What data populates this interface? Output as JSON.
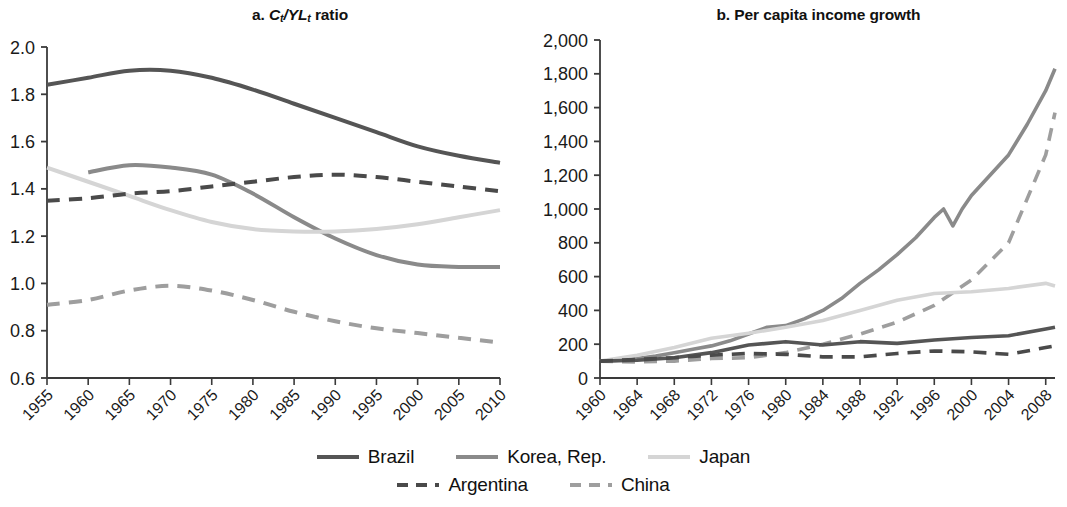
{
  "figure": {
    "background": "#ffffff",
    "panels": [
      {
        "id": "a",
        "title_plain": "a. Ct/YLt ratio"
      },
      {
        "id": "b",
        "title_plain": "b. Per capita income growth"
      }
    ]
  },
  "panel_a": {
    "title_prefix": "a.",
    "title_c": "C",
    "title_c_sub": "t",
    "title_slash": "/",
    "title_yl": "YL",
    "title_yl_sub": "t",
    "title_suffix": "ratio",
    "ytick_labels": [
      "2.0",
      "1.8",
      "1.6",
      "1.4",
      "1.2",
      "1.0",
      "0.8",
      "0.6"
    ],
    "xtick_labels": [
      "1955",
      "1960",
      "1965",
      "1970",
      "1975",
      "1980",
      "1985",
      "1990",
      "1995",
      "2000",
      "2005",
      "2010"
    ]
  },
  "panel_b": {
    "title": "b. Per capita income growth",
    "ytick_labels": [
      "2,000",
      "1,800",
      "1,600",
      "1,400",
      "1,200",
      "1,000",
      "800",
      "600",
      "400",
      "200",
      "0"
    ],
    "xtick_labels": [
      "1960",
      "1964",
      "1968",
      "1972",
      "1976",
      "1980",
      "1984",
      "1988",
      "1992",
      "1996",
      "2000",
      "2004",
      "2008"
    ]
  },
  "legend": {
    "row1": [
      {
        "label": "Brazil",
        "color": "#555555",
        "style": "solid",
        "key": "brazil"
      },
      {
        "label": "Korea, Rep.",
        "color": "#8a8a8a",
        "style": "solid",
        "key": "korea"
      },
      {
        "label": "Japan",
        "color": "#d5d5d5",
        "style": "solid",
        "key": "japan"
      }
    ],
    "row2": [
      {
        "label": "Argentina",
        "color": "#4a4a4a",
        "style": "dashed",
        "key": "argentina"
      },
      {
        "label": "China",
        "color": "#9e9e9e",
        "style": "dashed",
        "key": "china"
      }
    ]
  },
  "colors": {
    "brazil": "#555555",
    "korea": "#8a8a8a",
    "japan": "#d5d5d5",
    "argentina": "#4a4a4a",
    "china": "#9e9e9e",
    "axis": "#3a3a3a",
    "text": "#1a1a1a"
  },
  "chart_data": [
    {
      "type": "line",
      "panel": "a",
      "title": "a. Ct/YLt ratio",
      "xlabel": "",
      "ylabel": "",
      "xlim": [
        1955,
        2010
      ],
      "ylim": [
        0.6,
        2.0
      ],
      "ytick_step": 0.2,
      "xtick_step": 5,
      "grid": false,
      "legend_position": "bottom-center",
      "x": [
        1955,
        1960,
        1965,
        1970,
        1975,
        1980,
        1985,
        1990,
        1995,
        2000,
        2005,
        2010
      ],
      "series": [
        {
          "name": "Brazil",
          "style": "solid",
          "color": "#555555",
          "x": [
            1955,
            1960,
            1965,
            1970,
            1975,
            1980,
            1985,
            1990,
            1995,
            2000,
            2005,
            2010
          ],
          "values": [
            1.84,
            1.87,
            1.9,
            1.9,
            1.87,
            1.82,
            1.76,
            1.7,
            1.64,
            1.58,
            1.54,
            1.51
          ]
        },
        {
          "name": "Korea, Rep.",
          "style": "solid",
          "color": "#8a8a8a",
          "x": [
            1960,
            1965,
            1970,
            1975,
            1980,
            1985,
            1990,
            1995,
            2000,
            2005,
            2010
          ],
          "values": [
            1.47,
            1.5,
            1.49,
            1.46,
            1.38,
            1.28,
            1.19,
            1.12,
            1.08,
            1.07,
            1.07
          ]
        },
        {
          "name": "Japan",
          "style": "solid",
          "color": "#d5d5d5",
          "x": [
            1955,
            1960,
            1965,
            1970,
            1975,
            1980,
            1985,
            1990,
            1995,
            2000,
            2005,
            2010
          ],
          "values": [
            1.49,
            1.43,
            1.37,
            1.31,
            1.26,
            1.23,
            1.22,
            1.22,
            1.23,
            1.25,
            1.28,
            1.31
          ]
        },
        {
          "name": "Argentina",
          "style": "dashed",
          "color": "#4a4a4a",
          "x": [
            1955,
            1960,
            1965,
            1970,
            1975,
            1980,
            1985,
            1990,
            1995,
            2000,
            2005,
            2010
          ],
          "values": [
            1.35,
            1.36,
            1.38,
            1.39,
            1.41,
            1.43,
            1.45,
            1.46,
            1.45,
            1.43,
            1.41,
            1.39
          ]
        },
        {
          "name": "China",
          "style": "dashed",
          "color": "#9e9e9e",
          "x": [
            1955,
            1960,
            1965,
            1970,
            1975,
            1980,
            1985,
            1990,
            1995,
            2000,
            2005,
            2010
          ],
          "values": [
            0.91,
            0.93,
            0.97,
            0.99,
            0.97,
            0.93,
            0.88,
            0.84,
            0.81,
            0.79,
            0.77,
            0.75
          ]
        }
      ]
    },
    {
      "type": "line",
      "panel": "b",
      "title": "b. Per capita income growth",
      "xlabel": "",
      "ylabel": "",
      "xlim": [
        1960,
        2009
      ],
      "ylim": [
        0,
        2000
      ],
      "ytick_step": 200,
      "xtick_step": 4,
      "grid": false,
      "legend_position": "bottom-center",
      "series": [
        {
          "name": "Korea, Rep.",
          "style": "solid",
          "color": "#8a8a8a",
          "x": [
            1960,
            1962,
            1964,
            1966,
            1968,
            1970,
            1972,
            1974,
            1976,
            1978,
            1980,
            1982,
            1984,
            1986,
            1988,
            1990,
            1992,
            1994,
            1996,
            1997,
            1998,
            1999,
            2000,
            2002,
            2004,
            2006,
            2008,
            2009
          ],
          "values": [
            100,
            105,
            115,
            130,
            150,
            170,
            190,
            220,
            260,
            300,
            310,
            350,
            400,
            470,
            560,
            640,
            730,
            830,
            950,
            1000,
            900,
            1000,
            1080,
            1200,
            1320,
            1500,
            1700,
            1830
          ]
        },
        {
          "name": "China",
          "style": "dashed",
          "color": "#9e9e9e",
          "x": [
            1960,
            1964,
            1968,
            1972,
            1976,
            1980,
            1984,
            1988,
            1992,
            1996,
            2000,
            2004,
            2008,
            2009
          ],
          "values": [
            100,
            95,
            100,
            115,
            120,
            150,
            200,
            260,
            330,
            430,
            580,
            800,
            1320,
            1570
          ]
        },
        {
          "name": "Japan",
          "style": "solid",
          "color": "#d5d5d5",
          "x": [
            1960,
            1964,
            1968,
            1972,
            1976,
            1980,
            1984,
            1988,
            1992,
            1996,
            2000,
            2004,
            2008,
            2009
          ],
          "values": [
            100,
            135,
            180,
            235,
            265,
            300,
            340,
            400,
            460,
            500,
            510,
            530,
            560,
            545
          ]
        },
        {
          "name": "Brazil",
          "style": "solid",
          "color": "#555555",
          "x": [
            1960,
            1964,
            1968,
            1972,
            1976,
            1980,
            1984,
            1988,
            1992,
            1996,
            2000,
            2004,
            2008,
            2009
          ],
          "values": [
            100,
            105,
            120,
            150,
            195,
            215,
            195,
            215,
            205,
            225,
            240,
            250,
            290,
            300
          ]
        },
        {
          "name": "Argentina",
          "style": "dashed",
          "color": "#4a4a4a",
          "x": [
            1960,
            1964,
            1968,
            1972,
            1976,
            1980,
            1984,
            1988,
            1992,
            1996,
            2000,
            2004,
            2008,
            2009
          ],
          "values": [
            100,
            110,
            120,
            135,
            145,
            140,
            125,
            125,
            145,
            160,
            155,
            140,
            180,
            190
          ]
        }
      ]
    }
  ]
}
